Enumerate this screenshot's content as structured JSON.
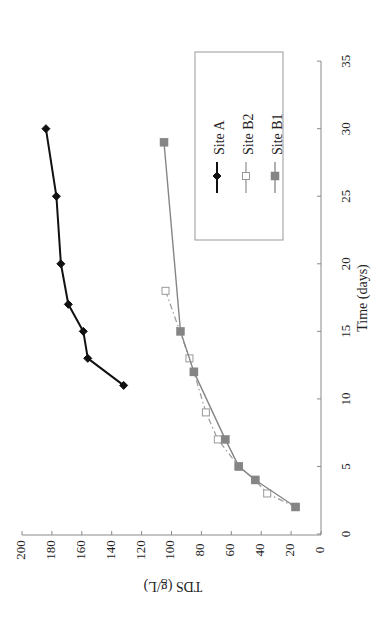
{
  "chart_data": {
    "type": "line",
    "orientation": "rotated -90deg (time axis vertical on right, TDS axis horizontal at bottom, text rotated)",
    "title": "",
    "xlabel": "Time (days)",
    "ylabel": "TDS (g/L)",
    "xlim": [
      0,
      35
    ],
    "ylim": [
      0,
      200
    ],
    "x_ticks": [
      0,
      5,
      10,
      15,
      20,
      25,
      30,
      35
    ],
    "y_ticks": [
      0,
      20,
      40,
      60,
      80,
      100,
      120,
      140,
      160,
      180,
      200
    ],
    "grid": false,
    "legend_position": "upper-left (in rotated view: inside plot near time axis top)",
    "series": [
      {
        "name": "Site A",
        "color": "#111111",
        "marker": "diamond-filled",
        "line": "solid",
        "x": [
          11,
          13,
          15,
          17,
          20,
          25,
          30
        ],
        "y": [
          132,
          156,
          159,
          169,
          174,
          177,
          184
        ]
      },
      {
        "name": "Site B2",
        "color": "#999999",
        "marker": "square-open",
        "line": "dash-dot",
        "x": [
          2,
          3,
          4,
          5,
          7,
          9,
          12,
          13,
          18
        ],
        "y": [
          17,
          36,
          44,
          55,
          69,
          77,
          85,
          88,
          104
        ]
      },
      {
        "name": "Site B1",
        "color": "#858585",
        "marker": "square-filled",
        "line": "solid",
        "x": [
          2,
          4,
          5,
          7,
          12,
          15,
          29
        ],
        "y": [
          17,
          44,
          55,
          64,
          85,
          94,
          105
        ]
      }
    ]
  },
  "axes": {
    "x_title": "Time (days)",
    "y_title": "TDS (g/L)",
    "x_tick_labels": [
      "0",
      "5",
      "10",
      "15",
      "20",
      "25",
      "30",
      "35"
    ],
    "y_tick_labels": [
      "0",
      "20",
      "40",
      "60",
      "80",
      "100",
      "120",
      "140",
      "160",
      "180",
      "200"
    ]
  },
  "legend": {
    "items": [
      {
        "label": "Site A",
        "marker": "diamond-filled",
        "color": "#111111"
      },
      {
        "label": "Site B2",
        "marker": "square-open",
        "color": "#999999"
      },
      {
        "label": "Site B1",
        "marker": "square-filled",
        "color": "#858585"
      }
    ]
  }
}
